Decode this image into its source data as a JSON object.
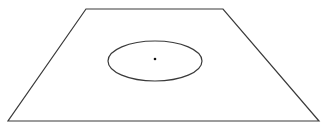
{
  "diagram": {
    "background": "#ffffff",
    "stroke_color": "#3a3a3a",
    "plane": {
      "shape": "trapezoid",
      "points": "86,9 223,9 319,121 8,121",
      "stroke_width": 1.2
    },
    "ellipse": {
      "cx": 155,
      "cy": 61,
      "rx": 47,
      "ry": 20,
      "stroke_width": 1.2
    },
    "center_point": {
      "cx": 155,
      "cy": 59,
      "r": 1.3,
      "fill": "#111111"
    }
  }
}
